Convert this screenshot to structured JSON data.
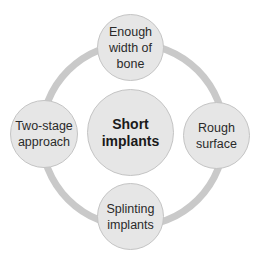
{
  "diagram": {
    "type": "hub-and-ring",
    "center": {
      "label": "Short\nimplants"
    },
    "nodes": [
      {
        "position": "top",
        "label": "Enough\nwidth of\nbone"
      },
      {
        "position": "right",
        "label": "Rough\nsurface"
      },
      {
        "position": "bottom",
        "label": "Splinting\nimplants"
      },
      {
        "position": "left",
        "label": "Two-stage\napproach"
      }
    ],
    "colors": {
      "ring": "#c9c9c9",
      "node_fill": "#e6e6e6",
      "node_border": "#c4c4c4",
      "text": "#2a2a2a"
    }
  }
}
